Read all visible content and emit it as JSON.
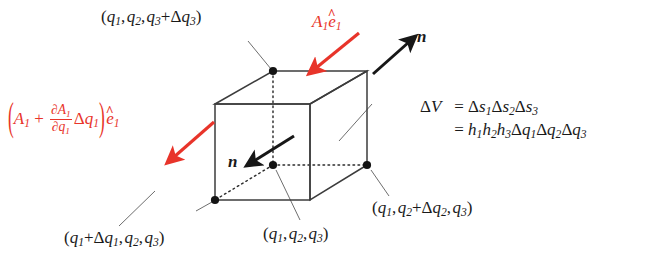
{
  "figure": {
    "type": "diagram",
    "accent_color": "#e8342a",
    "line_color": "#3c3c3c",
    "background": "#ffffff"
  },
  "labels": {
    "vertex_top_back_left": "(q1, q2, q3+Δq3)",
    "vertex_front_bottom_left": "(q1+Δq1, q2, q3)",
    "vertex_center": "(q1, q2, q3)",
    "vertex_bottom_back_right": "(q1, q2+Δq2, q3)",
    "flux_in": "A1 ê1",
    "flux_out": "(A1 + ∂A1/∂q1 Δq1) ê1",
    "normal_outer": "n",
    "normal_inner": "n",
    "volume_line1": "ΔV = Δs1Δs2Δs3",
    "volume_line2": "= h1h2h3Δq1Δq2Δq3"
  },
  "symbols": {
    "q": "q",
    "A": "A",
    "h": "h",
    "s": "s",
    "V": "V",
    "n": "n",
    "e": "e",
    "delta": "Δ",
    "partial": "∂",
    "hat": "^",
    "plus": "+",
    "equals": "=",
    "comma": ",",
    "lparen": "(",
    "rparen": ")",
    "sub1": "1",
    "sub2": "2",
    "sub3": "3"
  },
  "geometry": {
    "front_face": {
      "left": 215,
      "right": 310,
      "top": 104,
      "bottom": 200
    },
    "back_face": {
      "left": 273,
      "right": 367,
      "top": 71,
      "bottom": 165
    },
    "vertex_dots": [
      {
        "name": "top-back-left",
        "x": 273,
        "y": 71
      },
      {
        "name": "bottom-back-left-center",
        "x": 273,
        "y": 165
      },
      {
        "name": "bottom-front-left",
        "x": 215,
        "y": 200
      },
      {
        "name": "bottom-back-right",
        "x": 367,
        "y": 165
      }
    ]
  },
  "arrows": {
    "red_in": {
      "from": [
        359,
        33
      ],
      "to": [
        314,
        70
      ],
      "color": "#e8342a"
    },
    "red_out": {
      "from": [
        214,
        122
      ],
      "to": [
        172,
        159
      ],
      "color": "#e8342a"
    },
    "black_out": {
      "from": [
        373,
        73
      ],
      "to": [
        411,
        40
      ],
      "color": "#171717"
    },
    "black_in": {
      "from": [
        292,
        137
      ],
      "to": [
        252,
        162
      ],
      "color": "#171717"
    }
  }
}
